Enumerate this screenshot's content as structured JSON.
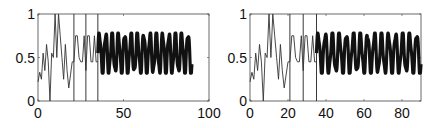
{
  "chart_data": [
    {
      "type": "line",
      "title": "",
      "xlabel": "",
      "ylabel": "",
      "xlim": [
        0,
        100
      ],
      "ylim": [
        0,
        1
      ],
      "xticks": [
        0,
        50,
        100
      ],
      "xtick_labels": [
        "0",
        "50",
        "100"
      ],
      "yticks": [
        0,
        0.5,
        1
      ],
      "ytick_labels": [
        "0",
        "0.5",
        "1"
      ],
      "grid": false,
      "vlines": [
        21,
        28,
        35
      ],
      "series": [
        {
          "name": "transient",
          "style": "thin",
          "x": [
            0,
            1,
            2,
            3,
            4,
            5,
            6,
            7,
            8,
            9,
            10,
            11,
            12,
            13,
            14,
            15,
            16,
            17,
            18,
            19,
            20,
            21,
            22,
            23,
            24,
            25,
            26,
            27,
            28,
            29,
            30,
            31,
            32,
            33,
            34,
            35
          ],
          "y": [
            0.22,
            0.33,
            0.25,
            0.55,
            0.35,
            0.65,
            0.45,
            0.0,
            0.55,
            0.5,
            1.0,
            0.5,
            1.0,
            0.75,
            0.5,
            0.25,
            0.65,
            0.35,
            0.15,
            0.3,
            0.45,
            0.45,
            0.75,
            0.75,
            0.5,
            0.45,
            0.45,
            0.75,
            0.35,
            0.75,
            0.75,
            0.45,
            0.45,
            0.75,
            0.45,
            0.45
          ]
        },
        {
          "name": "steady-oscillation",
          "style": "thick",
          "x_start": 35,
          "x_end": 90,
          "period": 3.7,
          "min": 0.32,
          "max": 0.78
        }
      ]
    },
    {
      "type": "line",
      "title": "",
      "xlabel": "",
      "ylabel": "",
      "xlim": [
        0,
        90
      ],
      "ylim": [
        0,
        1
      ],
      "xticks": [
        0,
        20,
        40,
        60,
        80
      ],
      "xtick_labels": [
        "0",
        "20",
        "40",
        "60",
        "80"
      ],
      "yticks": [
        0,
        0.5,
        1
      ],
      "ytick_labels": [
        "0",
        "0.5",
        "1"
      ],
      "grid": false,
      "vlines": [
        21,
        28,
        35
      ],
      "series": [
        {
          "name": "transient",
          "style": "thin",
          "x": [
            0,
            1,
            2,
            3,
            4,
            5,
            6,
            7,
            8,
            9,
            10,
            11,
            12,
            13,
            14,
            15,
            16,
            17,
            18,
            19,
            20,
            21,
            22,
            23,
            24,
            25,
            26,
            27,
            28,
            29,
            30,
            31,
            32,
            33,
            34,
            35
          ],
          "y": [
            0.22,
            0.33,
            0.25,
            0.55,
            0.35,
            0.65,
            0.45,
            0.0,
            0.55,
            0.5,
            1.0,
            0.5,
            1.0,
            0.75,
            0.5,
            0.25,
            0.65,
            0.35,
            0.15,
            0.3,
            0.45,
            0.45,
            0.75,
            0.75,
            0.5,
            0.45,
            0.45,
            0.75,
            0.35,
            0.75,
            0.75,
            0.45,
            0.45,
            0.75,
            0.45,
            0.45
          ]
        },
        {
          "name": "steady-oscillation",
          "style": "thick",
          "x_start": 35,
          "x_end": 90,
          "period": 3.7,
          "min": 0.32,
          "max": 0.78
        }
      ]
    }
  ]
}
